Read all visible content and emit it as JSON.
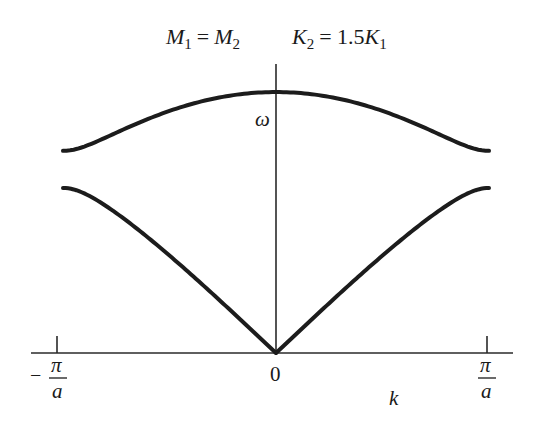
{
  "title": {
    "left_lhs": "M",
    "left_lhs_sub": "1",
    "left_eq": "=",
    "left_rhs": "M",
    "left_rhs_sub": "2",
    "right_lhs": "K",
    "right_lhs_sub": "2",
    "right_eq": "= 1.5",
    "right_rhs": "K",
    "right_rhs_sub": "1"
  },
  "axes": {
    "y_label": "ω",
    "x_label": "k",
    "origin_label": "0",
    "left_tick": {
      "sign": "−",
      "numerator": "π",
      "denominator": "a"
    },
    "right_tick": {
      "numerator": "π",
      "denominator": "a"
    }
  },
  "colors": {
    "curve": "#1c1c1c",
    "axis": "#2a2a2a",
    "background": "#ffffff"
  },
  "chart_data": {
    "type": "line",
    "xlabel": "k",
    "ylabel": "ω",
    "x_ticks": [
      "-π/a",
      "0",
      "π/a"
    ],
    "xlim": [
      -1,
      1
    ],
    "x_unit": "π/a",
    "parameters": {
      "M1_over_M2": 1.0,
      "K2_over_K1": 1.5
    },
    "formula": "ω² ∝ (K1+K2) ± sqrt(K1² + K2² + 2·K1·K2·cos(ka))",
    "series": [
      {
        "name": "optical branch",
        "x": [
          -1,
          -0.75,
          -0.5,
          -0.25,
          0,
          0.25,
          0.5,
          0.75,
          1
        ],
        "values": [
          1.732,
          1.807,
          1.981,
          2.161,
          2.236,
          2.161,
          1.981,
          1.807,
          1.732
        ]
      },
      {
        "name": "acoustic branch",
        "x": [
          -1,
          -0.75,
          -0.5,
          -0.25,
          0,
          0.25,
          0.5,
          0.75,
          1
        ],
        "values": [
          1.414,
          1.311,
          1.008,
          0.536,
          0.0,
          0.536,
          1.008,
          1.311,
          1.414
        ]
      }
    ],
    "ylim": [
      0,
      2.3
    ],
    "grid": false,
    "legend": "none"
  }
}
